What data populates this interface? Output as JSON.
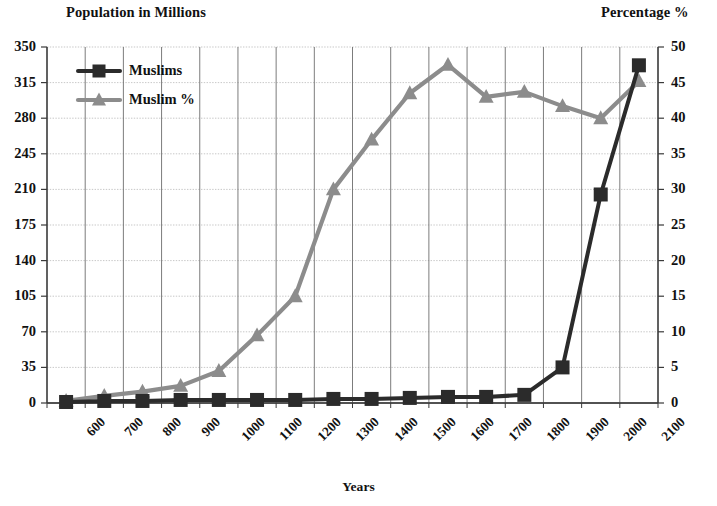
{
  "chart_data": {
    "type": "line",
    "title": "",
    "categories": [
      "600",
      "700",
      "800",
      "900",
      "1000",
      "1100",
      "1200",
      "1300",
      "1400",
      "1500",
      "1600",
      "1700",
      "1800",
      "1900",
      "2000",
      "2100"
    ],
    "xlabel": "Years",
    "ylabel": "Population in Millions",
    "y2label": "Percentage %",
    "ylim": [
      0,
      350
    ],
    "y2lim": [
      0,
      50
    ],
    "yticks": [
      "0",
      "35",
      "70",
      "105",
      "140",
      "175",
      "210",
      "245",
      "280",
      "315",
      "350"
    ],
    "y2ticks": [
      "0",
      "5",
      "10",
      "15",
      "20",
      "25",
      "30",
      "35",
      "40",
      "45",
      "50"
    ],
    "grid": true,
    "legend_position": "top-left",
    "series": [
      {
        "name": "Muslims",
        "axis": "left",
        "unit": "millions",
        "color": "#2b2b2b",
        "marker": "square",
        "values": [
          1,
          2,
          2,
          3,
          3,
          3,
          3,
          4,
          4,
          5,
          6,
          6,
          8,
          35,
          205,
          332
        ]
      },
      {
        "name": "Muslim %",
        "axis": "right",
        "unit": "percent",
        "color": "#8c8c8c",
        "marker": "triangle",
        "values": [
          0.3,
          1.0,
          1.6,
          2.4,
          4.5,
          9.5,
          15.0,
          30.0,
          37.0,
          43.5,
          47.5,
          43.0,
          43.7,
          41.7,
          40.0,
          45.2
        ]
      }
    ]
  },
  "legend": {
    "items": [
      {
        "label": "Muslims",
        "marker": "square",
        "color": "#2b2b2b"
      },
      {
        "label": "Muslim %",
        "marker": "triangle",
        "color": "#8c8c8c"
      }
    ]
  }
}
